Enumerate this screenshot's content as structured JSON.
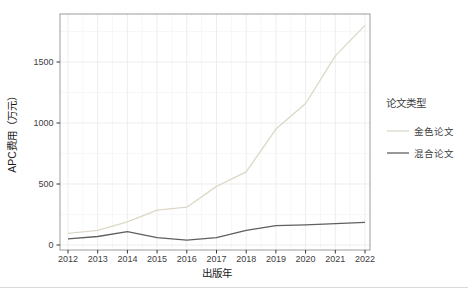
{
  "chart_data": {
    "type": "line",
    "title": "",
    "xlabel": "出版年",
    "ylabel": "APC费用（万元）",
    "x": [
      2012,
      2013,
      2014,
      2015,
      2016,
      2017,
      2018,
      2019,
      2020,
      2021,
      2022
    ],
    "series": [
      {
        "name": "金色论文",
        "color": "#dcd8c7",
        "values": [
          95,
          120,
          190,
          285,
          310,
          480,
          600,
          950,
          1160,
          1550,
          1800
        ]
      },
      {
        "name": "混合论文",
        "color": "#5f5f5f",
        "values": [
          50,
          70,
          110,
          60,
          40,
          60,
          120,
          158,
          165,
          175,
          185
        ]
      }
    ],
    "ylim": [
      0,
      1900
    ],
    "yticks": [
      0,
      500,
      1000,
      1500
    ],
    "legend_title": "论文类型",
    "legend_position": "right",
    "grid": true
  },
  "colors": {
    "panel_border": "#9b9b9b",
    "grid_major": "#ededed",
    "grid_minor": "#f7f7f7",
    "tick_mark": "#333333",
    "tick_label": "#404040",
    "axis_title": "#1a1a1a",
    "legend_text": "#333333",
    "background": "#ffffff",
    "bottom_divider": "#d9d9d9"
  }
}
